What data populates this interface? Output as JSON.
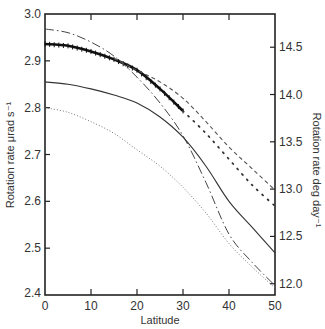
{
  "chart_data": {
    "type": "line",
    "title": "",
    "xlabel": "Latitude",
    "ylabel": "Rotation rate μrad s⁻¹",
    "ylabel_right": "Rotation rate deg day⁻¹",
    "xlim": [
      0,
      50
    ],
    "ylim": [
      2.4,
      3.0
    ],
    "ylim_right": [
      11.88,
      14.85
    ],
    "grid": false,
    "legend": "none",
    "x_ticks": [
      "0",
      "10",
      "20",
      "30",
      "40",
      "50"
    ],
    "y_ticks": [
      "2.4",
      "2.5",
      "2.6",
      "2.7",
      "2.8",
      "2.9",
      "3.0"
    ],
    "y_ticks_right": [
      "12.0",
      "12.5",
      "13.0",
      "13.5",
      "14.0",
      "14.5"
    ],
    "series": [
      {
        "name": "thick-observed",
        "style": "thick-solid-with-markers",
        "x": [
          0,
          5,
          10,
          15,
          20,
          25,
          30
        ],
        "y": [
          2.936,
          2.932,
          2.92,
          2.903,
          2.88,
          2.84,
          2.793
        ]
      },
      {
        "name": "dash-dot",
        "style": "dash-dot",
        "x": [
          0,
          5,
          10,
          15,
          20,
          25,
          30,
          35,
          40,
          45,
          50
        ],
        "y": [
          2.968,
          2.96,
          2.94,
          2.91,
          2.865,
          2.81,
          2.74,
          2.64,
          2.53,
          2.47,
          2.42
        ]
      },
      {
        "name": "dashed",
        "style": "dashed",
        "x": [
          15,
          20,
          25,
          30,
          35,
          40,
          45,
          50
        ],
        "y": [
          2.905,
          2.88,
          2.855,
          2.82,
          2.77,
          2.716,
          2.67,
          2.624
        ]
      },
      {
        "name": "large-dotted",
        "style": "large-dots",
        "x": [
          30,
          35,
          40,
          45,
          50
        ],
        "y": [
          2.793,
          2.745,
          2.69,
          2.635,
          2.59
        ]
      },
      {
        "name": "solid",
        "style": "thin-solid",
        "x": [
          0,
          5,
          10,
          15,
          20,
          25,
          30,
          35,
          40,
          45,
          50
        ],
        "y": [
          2.855,
          2.85,
          2.84,
          2.827,
          2.81,
          2.78,
          2.737,
          2.675,
          2.6,
          2.545,
          2.49
        ]
      },
      {
        "name": "fine-dotted",
        "style": "fine-dots",
        "x": [
          0,
          5,
          10,
          15,
          20,
          25,
          30,
          35,
          40,
          45,
          50
        ],
        "y": [
          2.8,
          2.79,
          2.77,
          2.745,
          2.71,
          2.675,
          2.63,
          2.575,
          2.51,
          2.46,
          2.415
        ]
      }
    ]
  }
}
